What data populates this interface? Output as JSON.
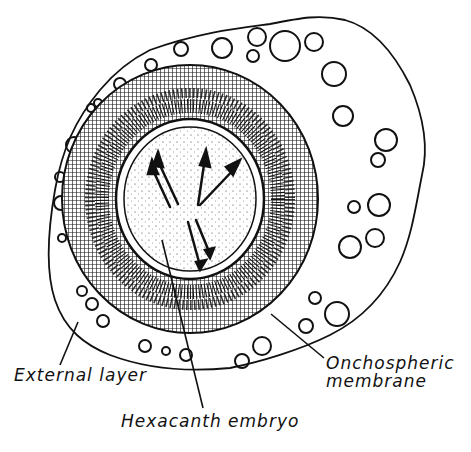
{
  "figure": {
    "labels": {
      "external_layer": "External layer",
      "onchospheric_membrane_line1": "Onchospheric",
      "onchospheric_membrane_line2": "membrane",
      "hexacanth_embryo": "Hexacanth embryo"
    },
    "colors": {
      "ink": "#111111",
      "background": "#ffffff"
    }
  }
}
